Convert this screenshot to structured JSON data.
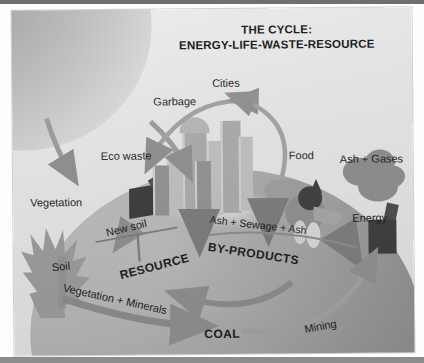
{
  "diagram": {
    "title_line1": "THE CYCLE:",
    "title_line2": "ENERGY-LIFE-WASTE-RESOURCE",
    "palette": {
      "background": "#e6e6e6",
      "sun": "#a2a2a2",
      "globe": "#a9a9a9",
      "arrow": "#8a8a8a",
      "text": "#1b1b1b",
      "bin": "#3a3a3a",
      "factory": "#3b3b3b"
    },
    "labels": {
      "vegetation": "Vegetation",
      "eco_waste": "Eco waste",
      "garbage": "Garbage",
      "cities": "Cities",
      "food": "Food",
      "ash_gases": "Ash + Gases",
      "energy": "Energy",
      "soil": "Soil",
      "new_soil": "New soil",
      "resource": "RESOURCE",
      "byproducts": "BY-PRODUCTS",
      "ash_sewage_ash": "Ash  +   Sewage  +   Ash",
      "vegetation_minerals": "Vegetation + Minerals",
      "coal": "COAL",
      "mining": "Mining"
    },
    "elements": {
      "sun_name": "sun",
      "globe_name": "earth-globe",
      "bin_name": "waste-bin",
      "factory_name": "factory-smokestack",
      "city_name": "city-skyline",
      "trees_name": "trees",
      "animal_name": "livestock-animal"
    },
    "flow": [
      {
        "from": "Sun",
        "to": "Vegetation",
        "kind": "energy"
      },
      {
        "from": "Sun",
        "to": "Eco waste",
        "kind": "energy"
      },
      {
        "from": "Garbage",
        "to": "Eco waste",
        "kind": "waste"
      },
      {
        "from": "Cities",
        "to": "Garbage",
        "kind": "waste"
      },
      {
        "from": "Eco waste",
        "to": "New soil",
        "kind": "resource"
      },
      {
        "from": "New soil",
        "to": "RESOURCE",
        "kind": "resource"
      },
      {
        "from": "Cities",
        "to": "Ash + Sewage + Ash",
        "kind": "by-products"
      },
      {
        "from": "BY-PRODUCTS",
        "to": "RESOURCE",
        "kind": "recycle"
      },
      {
        "from": "Vegetation + Minerals",
        "to": "COAL",
        "kind": "geologic"
      },
      {
        "from": "COAL",
        "to": "Mining",
        "kind": "extraction"
      },
      {
        "from": "Mining",
        "to": "Energy",
        "kind": "energy"
      },
      {
        "from": "Energy",
        "to": "Ash + Gases",
        "kind": "emission"
      },
      {
        "from": "Food",
        "to": "Cities",
        "kind": "life"
      }
    ]
  }
}
